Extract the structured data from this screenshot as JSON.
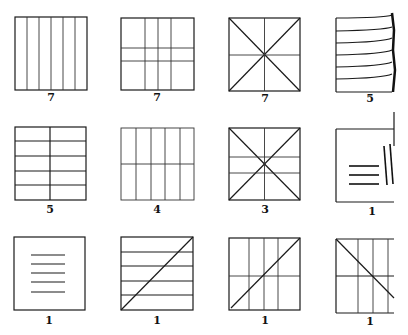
{
  "figure": {
    "rows": [
      [
        {
          "pattern": "six-vertical-columns",
          "count": "7"
        },
        {
          "pattern": "grid-4-cols-3-rows",
          "count": "7"
        },
        {
          "pattern": "square-with-diagonals-and-center-cross",
          "count": "7"
        },
        {
          "pattern": "horizontal-lines-curving-right-edge",
          "count": "5"
        }
      ],
      [
        {
          "pattern": "two-cols-six-rows",
          "count": "5"
        },
        {
          "pattern": "five-cols-two-rows",
          "count": "4"
        },
        {
          "pattern": "diagonals-center-vertical-two-horizontals",
          "count": "3"
        },
        {
          "pattern": "open-square-with-three-short-lines-and-two-slants",
          "count": "1"
        }
      ],
      [
        {
          "pattern": "square-with-five-short-horizontal-lines",
          "count": "1"
        },
        {
          "pattern": "five-horizontal-bands-with-diagonal",
          "count": "1"
        },
        {
          "pattern": "four-cols-two-rows-with-diagonal",
          "count": "1"
        },
        {
          "pattern": "open-grid-with-descending-diagonal",
          "count": "1"
        }
      ]
    ]
  }
}
